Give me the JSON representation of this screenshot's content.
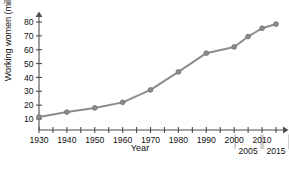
{
  "chart_data": {
    "type": "line",
    "title": "",
    "xlabel": "Year",
    "ylabel": "Working women (millions)",
    "x": [
      1930,
      1940,
      1950,
      1960,
      1970,
      1980,
      1990,
      2000,
      2005,
      2010,
      2015
    ],
    "values": [
      11.5,
      15,
      18,
      22,
      31,
      44,
      57.5,
      62,
      69.5,
      75.5,
      78.5
    ],
    "series": [
      {
        "name": "Working women (millions)",
        "values": [
          11.5,
          15,
          18,
          22,
          31,
          44,
          57.5,
          62,
          69.5,
          75.5,
          78.5
        ]
      }
    ],
    "xlim": [
      1930,
      2015
    ],
    "ylim": [
      0,
      85
    ],
    "ytick_labels": [
      "10",
      "20",
      "30",
      "40",
      "50",
      "60",
      "70",
      "80"
    ],
    "ytick_values": [
      10,
      20,
      30,
      40,
      50,
      60,
      70,
      80
    ],
    "xtick_labels_primary": [
      "1930",
      "1940",
      "1950",
      "1960",
      "1970",
      "1980",
      "1990",
      "2000",
      "2010"
    ],
    "xtick_values_primary": [
      1930,
      1940,
      1950,
      1960,
      1970,
      1980,
      1990,
      2000,
      2010
    ],
    "xtick_labels_secondary": [
      "2005",
      "2015"
    ],
    "xtick_values_secondary": [
      2005,
      2015
    ],
    "xtick_minor_step": 5,
    "grid": false,
    "legend": "none",
    "line_color": "#8c8c8c",
    "marker_color": "#8c8c8c",
    "axis_color": "#4d4d4d"
  }
}
